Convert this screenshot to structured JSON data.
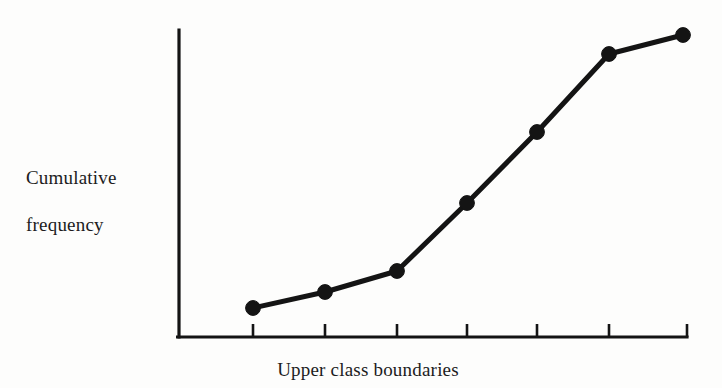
{
  "figure": {
    "background_color": "#fdfdfc",
    "ink_color": "#141414"
  },
  "labels": {
    "ylabel": "Cumulative\nfrequency",
    "ylabel_line1": "Cumulative",
    "ylabel_line2": "frequency",
    "xlabel": "Upper class boundaries"
  },
  "chart_data": {
    "type": "line",
    "title": "",
    "xlabel": "Upper class boundaries",
    "ylabel": "Cumulative frequency",
    "grid": false,
    "legend": null,
    "axis_ticks_labeled": false,
    "marker": "filled-circle",
    "categories": [
      "1",
      "2",
      "3",
      "4",
      "5",
      "6",
      "7"
    ],
    "x": [
      1,
      2,
      3,
      4,
      5,
      6,
      7
    ],
    "values": [
      8,
      14,
      22,
      46,
      71,
      98,
      104
    ],
    "xlim": [
      0.4,
      7.2
    ],
    "ylim": [
      0,
      112
    ],
    "series": [
      {
        "name": "Cumulative frequency",
        "values": [
          8,
          14,
          22,
          46,
          71,
          98,
          104
        ]
      }
    ],
    "pixel_points": [
      {
        "x": 253,
        "y": 308
      },
      {
        "x": 325,
        "y": 292
      },
      {
        "x": 397,
        "y": 271
      },
      {
        "x": 467,
        "y": 203
      },
      {
        "x": 537,
        "y": 132
      },
      {
        "x": 609,
        "y": 54
      },
      {
        "x": 683,
        "y": 35
      }
    ],
    "axes_pixels": {
      "origin_x": 179,
      "origin_y": 337,
      "y_axis_top": 30,
      "x_axis_right": 687,
      "tick_x": [
        253,
        325,
        397,
        467,
        537,
        609,
        687
      ],
      "tick_length": 13
    }
  }
}
